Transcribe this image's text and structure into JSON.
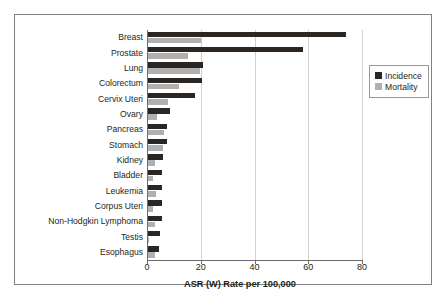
{
  "chart_data": {
    "type": "bar",
    "orientation": "horizontal",
    "title": "",
    "xlabel": "ASR (W) Rate per 100,000",
    "ylabel": "",
    "xlim": [
      0,
      80
    ],
    "xticks": [
      0,
      20,
      40,
      60,
      80
    ],
    "xtick_labels": [
      "0",
      "20",
      "40",
      "60",
      "80"
    ],
    "grid": "vertical",
    "legend_position": "right",
    "categories": [
      "Breast",
      "Prostate",
      "Lung",
      "Colorectum",
      "Cervix Uteri",
      "Ovary",
      "Pancreas",
      "Stomach",
      "Kidney",
      "Bladder",
      "Leukemia",
      "Corpus Uteri",
      "Non-Hodgkin Lymphoma",
      "Testis",
      "Esophagus"
    ],
    "series": [
      {
        "name": "Incidence",
        "color": "#2b2622",
        "values": [
          73.7,
          57.7,
          20.5,
          20.0,
          17.5,
          8.2,
          7.0,
          7.0,
          5.6,
          5.3,
          5.2,
          5.2,
          5.2,
          4.3,
          4.1
        ]
      },
      {
        "name": "Mortality",
        "color": "#b0b0b0",
        "values": [
          19.7,
          15.0,
          19.4,
          11.5,
          7.4,
          3.5,
          6.0,
          5.5,
          2.7,
          1.8,
          3.0,
          1.8,
          2.5,
          0.5,
          2.7
        ]
      }
    ]
  },
  "legend": {
    "entries": [
      {
        "label": "Incidence"
      },
      {
        "label": "Mortality"
      }
    ]
  }
}
